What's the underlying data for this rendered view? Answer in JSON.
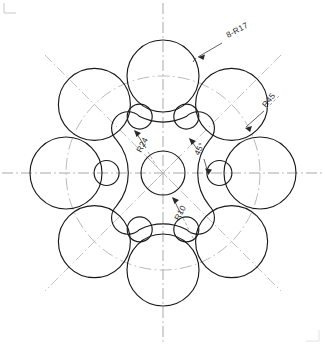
{
  "drawing": {
    "title": "Flange plate with eight circular lobes",
    "view": "front-view",
    "units": "mm",
    "background_color": "#ffffff",
    "line_color": "#1a1a1a",
    "centerline_color": "#9a9a9a",
    "center": {
      "x": 163,
      "y": 173
    },
    "scale_px_per_unit": 2.16
  },
  "dimensions": [
    {
      "id": "lobe-circles",
      "label": "8-R17",
      "value": 17,
      "quantity": 8,
      "type": "radius",
      "text_x": 228,
      "text_y": 38,
      "rotation": -28,
      "leader": {
        "x1": 221,
        "y1": 44,
        "x2": 196,
        "y2": 58
      }
    },
    {
      "id": "bolt-circle",
      "label": "R45",
      "value": 45,
      "type": "radius",
      "text_x": 268,
      "text_y": 107,
      "rotation": -52,
      "leader": {
        "x1": 263,
        "y1": 112,
        "x2": 245,
        "y2": 128
      }
    },
    {
      "id": "hub-ring",
      "label": "R24",
      "value": 24,
      "type": "radius",
      "text_x": 142,
      "text_y": 152,
      "rotation": -62,
      "leader": {
        "x1": 147,
        "y1": 147,
        "x2": 135,
        "y2": 130
      }
    },
    {
      "id": "lobe-spacing-angle",
      "label": "45°",
      "value": 45,
      "type": "angle",
      "text_x": 200,
      "text_y": 153,
      "rotation": -64,
      "leader": {
        "x1": 198,
        "y1": 148,
        "x2": 192,
        "y2": 138
      }
    },
    {
      "id": "center-bore",
      "label": "R10",
      "value": 10,
      "type": "radius",
      "text_x": 180,
      "text_y": 220,
      "rotation": -62,
      "leader": {
        "x1": 180,
        "y1": 214,
        "x2": 172,
        "y2": 198
      }
    }
  ],
  "geometry": {
    "center_bore": {
      "cx": 163,
      "cy": 173,
      "r": 22
    },
    "hub_ring_radius": 52,
    "bolt_circle_radius": 97,
    "lobe_radius": 36,
    "small_circle_radius": 12.5,
    "small_circle_center_radius": 61,
    "lobe_count": 8,
    "small_circle_count": 8,
    "lobe_start_angle_deg": -90,
    "small_circle_start_angle_deg": -67.5
  },
  "centerlines": {
    "horizontal": {
      "y": 173,
      "x1": 2,
      "x2": 323
    },
    "vertical": {
      "x": 163,
      "y1": 3,
      "y2": 342
    },
    "diagonals_deg": [
      45,
      135
    ]
  },
  "corner_marks": [
    {
      "id": "top-left",
      "x": 4,
      "y": 4
    },
    {
      "id": "bottom-right",
      "x": 318,
      "y": 340
    }
  ],
  "icons": {
    "arrowhead": "arrow-icon",
    "centerline": "centerline-icon"
  }
}
